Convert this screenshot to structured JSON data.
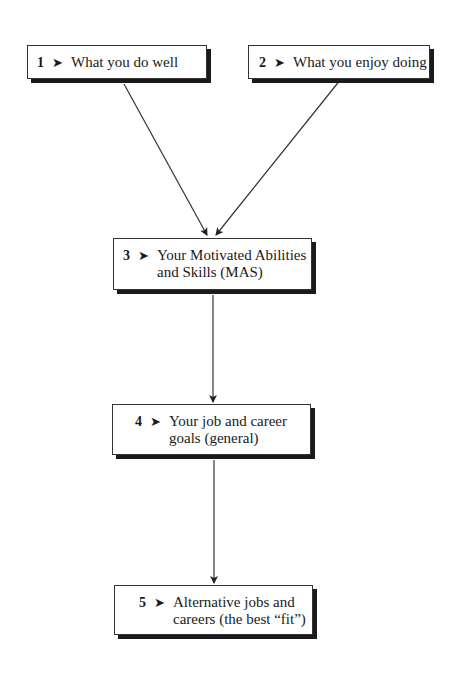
{
  "diagram": {
    "nodes": [
      {
        "id": "1",
        "number": "1",
        "text": "What you do well"
      },
      {
        "id": "2",
        "number": "2",
        "text": "What you enjoy doing"
      },
      {
        "id": "3",
        "number": "3",
        "text_line1": "Your Motivated Abilities",
        "text_line2": "and Skills (MAS)"
      },
      {
        "id": "4",
        "number": "4",
        "text_line1": "Your job and career",
        "text_line2": "goals (general)"
      },
      {
        "id": "5",
        "number": "5",
        "text_line1": "Alternative jobs and",
        "text_line2": "careers (the best “fit”)"
      }
    ],
    "edges": [
      {
        "from": "1",
        "to": "3"
      },
      {
        "from": "2",
        "to": "3"
      },
      {
        "from": "3",
        "to": "4"
      },
      {
        "from": "4",
        "to": "5"
      }
    ],
    "bullet_glyph": "➤",
    "colors": {
      "stroke": "#333333",
      "shadow": "#1a1a1a",
      "background": "#ffffff"
    }
  }
}
